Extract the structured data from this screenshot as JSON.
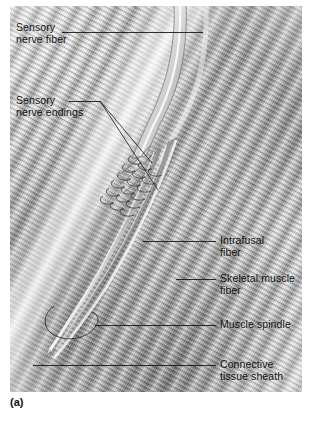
{
  "figure": {
    "caption": "(a)",
    "style": "grayscale-airbrush-illustration",
    "palette": {
      "background": "#ffffff",
      "plate_light": "#f3f3f3",
      "plate_mid": "#b4b4b4",
      "plate_dark": "#6f6f6f",
      "leader_line": "#1a1a1a",
      "label_text": "#141414"
    }
  },
  "labels": [
    {
      "id": "sensory-nerve-fiber",
      "text": "Sensory\nnerve fiber",
      "side": "left",
      "x": 16,
      "y": 21,
      "leader": {
        "from": [
          62,
          32
        ],
        "to": [
          203,
          32
        ],
        "branches": []
      }
    },
    {
      "id": "sensory-nerve-endings",
      "text": "Sensory\nnerve endings",
      "side": "left",
      "x": 16,
      "y": 94,
      "leader": {
        "from": [
          69,
          101
        ],
        "to": [
          100,
          101
        ],
        "branches": [
          [
            [
              100,
              101
            ],
            [
              152,
              163
            ]
          ],
          [
            [
              100,
              101
            ],
            [
              158,
              190
            ]
          ]
        ]
      }
    },
    {
      "id": "intrafusal-fiber",
      "text": "Intrafusal\nfiber",
      "side": "right",
      "x": 220,
      "y": 234,
      "leader": {
        "from": [
          143,
          241
        ],
        "to": [
          216,
          241
        ],
        "branches": []
      }
    },
    {
      "id": "skeletal-muscle-fiber",
      "text": "Skeletal muscle\nfiber",
      "side": "right",
      "x": 220,
      "y": 272,
      "leader": {
        "from": [
          176,
          279
        ],
        "to": [
          216,
          279
        ],
        "branches": []
      }
    },
    {
      "id": "muscle-spindle",
      "text": "Muscle spindle",
      "side": "right",
      "x": 220,
      "y": 318,
      "leader": {
        "from": [
          95,
          325
        ],
        "to": [
          216,
          325
        ],
        "branches": []
      }
    },
    {
      "id": "connective-tissue-sheath",
      "text": "Connective\ntissue sheath",
      "side": "right",
      "x": 220,
      "y": 358,
      "leader": {
        "from": [
          33,
          365
        ],
        "to": [
          216,
          365
        ],
        "branches": []
      }
    }
  ]
}
